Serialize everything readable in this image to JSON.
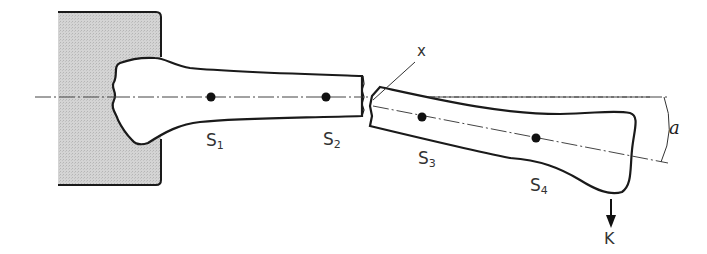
{
  "diagram": {
    "type": "mechanical bone fracture bending diagram",
    "labels": {
      "s1": {
        "base": "S",
        "sub": "1"
      },
      "s2": {
        "base": "S",
        "sub": "2"
      },
      "s3": {
        "base": "S",
        "sub": "3"
      },
      "s4": {
        "base": "S",
        "sub": "4"
      },
      "fracture": "x",
      "angle": "a",
      "force": "K"
    },
    "colors": {
      "line": "#1a1a1a",
      "clamp_fill": "#cfcfcf",
      "axis": "#444444"
    }
  }
}
